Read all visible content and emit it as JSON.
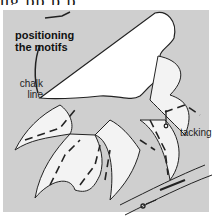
{
  "header": {
    "partial_text": "ng pp p p"
  },
  "diagram": {
    "title_line1": "positioning",
    "title_line2": "the motifs",
    "labels": {
      "chalk_line_1": "chalk",
      "chalk_line_2": "line",
      "tacking": "tacking"
    },
    "colors": {
      "background_panel": "#cfcfcf",
      "motif_fill": "#ffffff",
      "stroke": "#222222"
    }
  }
}
